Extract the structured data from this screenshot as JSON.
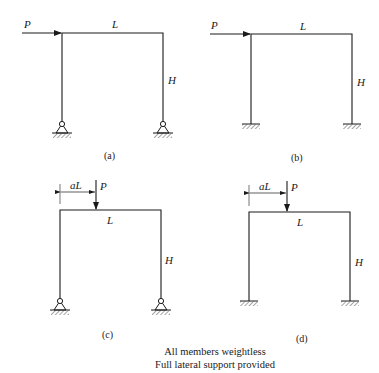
{
  "frames": [
    {
      "id": "a",
      "caption": "(a)",
      "support": "pinned",
      "load": {
        "type": "horizontal",
        "label": "P"
      },
      "span_label": "L",
      "height_label": "H"
    },
    {
      "id": "b",
      "caption": "(b)",
      "support": "fixed",
      "load": {
        "type": "horizontal",
        "label": "P"
      },
      "span_label": "L",
      "height_label": "H"
    },
    {
      "id": "c",
      "caption": "(c)",
      "support": "pinned",
      "load": {
        "type": "vertical",
        "label": "P",
        "position_label": "aL"
      },
      "span_label": "L",
      "height_label": "H"
    },
    {
      "id": "d",
      "caption": "(d)",
      "support": "fixed",
      "load": {
        "type": "vertical",
        "label": "P",
        "position_label": "aL"
      },
      "span_label": "L",
      "height_label": "H"
    }
  ],
  "notes": {
    "line1": "All members weightless",
    "line2": "Full lateral support provided"
  },
  "colors": {
    "ink": "#1a1a1a",
    "background": "#ffffff"
  }
}
